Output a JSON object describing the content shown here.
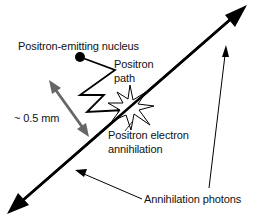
{
  "labels": {
    "nucleus": "Positron-emitting nucleus",
    "path_line1": "Positron",
    "path_line2": "path",
    "distance": "~ 0.5 mm",
    "annihilation_line1": "Positron electron",
    "annihilation_line2": "annihilation",
    "photons": "Annihilation photons"
  },
  "colors": {
    "line": "#000000",
    "range_arrow": "#666666",
    "text": "#111111"
  },
  "icons": {
    "nucleus": "filled-circle",
    "annihilation": "starburst",
    "photon_direction": "double-headed-arrow",
    "range": "gray-double-arrow"
  }
}
